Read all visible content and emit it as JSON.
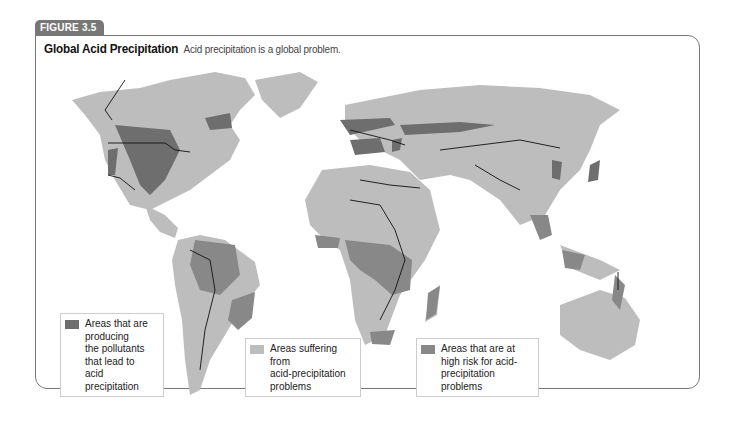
{
  "figure": {
    "label": "FIGURE 3.5",
    "title": "Global Acid Precipitation",
    "caption": "Acid precipitation is a global problem."
  },
  "colors": {
    "frame": "#777777",
    "land_base": "#bdbdbd",
    "producing": "#6e6e6e",
    "suffering": "#bdbdbd",
    "high_risk": "#888888",
    "borders": "#111111"
  },
  "legend": [
    {
      "key": "producing",
      "label": "Areas that are\nproducing\nthe pollutants\nthat lead to\nacid precipitation",
      "color": "#6e6e6e"
    },
    {
      "key": "suffering",
      "label": "Areas suffering from\nacid-precipitation\nproblems",
      "color": "#bdbdbd"
    },
    {
      "key": "high_risk",
      "label": "Areas that are at\nhigh risk for acid-\nprecipitation problems",
      "color": "#888888"
    }
  ],
  "map_regions": {
    "producing": [
      "North America (Great Lakes / eastern US)",
      "Western Europe",
      "Eastern China",
      "Japan"
    ],
    "suffering": [
      "North America",
      "South America",
      "Europe",
      "Africa",
      "Asia",
      "Australia"
    ],
    "high_risk": [
      "Amazon Basin",
      "Central Africa",
      "Southeast Asia",
      "Southeastern Brazil",
      "Madagascar",
      "Southern Africa"
    ]
  }
}
